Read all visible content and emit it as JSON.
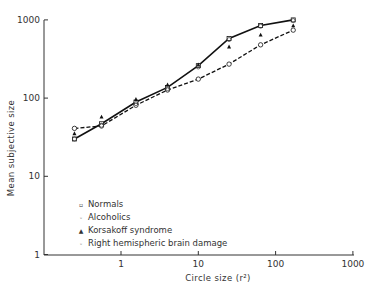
{
  "chart_data": {
    "type": "line",
    "title": "",
    "xlabel": "Circle size (r²)",
    "ylabel": "Mean subjective size",
    "xscale": "log",
    "yscale": "log",
    "xlim": [
      0.1,
      1000
    ],
    "ylim": [
      1,
      1000
    ],
    "x_ticks": [
      "1",
      "10",
      "100",
      "1000"
    ],
    "y_ticks": [
      "1",
      "10",
      "100",
      "1000"
    ],
    "grid": false,
    "legend_position": "lower-left inside",
    "x": [
      0.25,
      0.56,
      1.56,
      4,
      10,
      25,
      64,
      169
    ],
    "series": [
      {
        "name": "Normals",
        "marker": "square-open",
        "line": "solid",
        "values": [
          30,
          47,
          89,
          137,
          260,
          580,
          850,
          1000
        ]
      },
      {
        "name": "Alcoholics",
        "marker": "circle-open",
        "line": "dashed",
        "values": [
          41,
          44,
          81,
          127,
          175,
          272,
          480,
          740
        ]
      },
      {
        "name": "Korsakoff syndrome",
        "marker": "triangle-filled",
        "line": "none",
        "values": [
          35,
          57,
          96,
          147,
          265,
          450,
          640,
          840
        ]
      },
      {
        "name": "Right hemispheric brain damage",
        "marker": "circle-dot",
        "line": "none",
        "values": [
          30,
          45,
          85,
          132,
          250,
          560,
          830,
          980
        ]
      }
    ]
  },
  "legend": {
    "items": [
      {
        "label": "Normals",
        "symbol": "▫"
      },
      {
        "label": "Alcoholics",
        "symbol": "◦"
      },
      {
        "label": "Korsakoff syndrome",
        "symbol": "▲"
      },
      {
        "label": "Right hemispheric brain damage",
        "symbol": "◦"
      }
    ]
  },
  "axes": {
    "xlabel": "Circle size (r²)",
    "ylabel": "Mean subjective size",
    "x_ticks": [
      "1",
      "10",
      "100",
      "1000"
    ],
    "y_ticks": [
      "1",
      "10",
      "100",
      "1000"
    ]
  }
}
